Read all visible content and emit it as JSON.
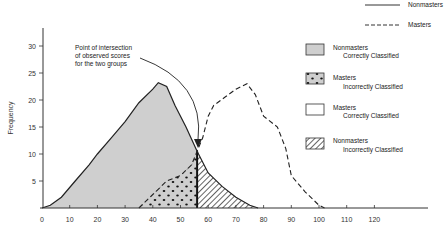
{
  "chart_data": {
    "type": "area",
    "title": "",
    "xlabel": "",
    "ylabel": "Frequency",
    "xlim": [
      0,
      130
    ],
    "ylim": [
      0,
      33
    ],
    "x_ticks": [
      "0",
      "10",
      "20",
      "30",
      "40",
      "50",
      "60",
      "70",
      "80",
      "90",
      "100",
      "110",
      "120"
    ],
    "y_ticks": [
      "5",
      "10",
      "15",
      "20",
      "25",
      "30"
    ],
    "grid": false,
    "legend_position": "right",
    "line_legend": [
      {
        "name": "Nonmasters",
        "style": "solid"
      },
      {
        "name": "Masters",
        "style": "dashed"
      }
    ],
    "series": [
      {
        "name": "Nonmasters",
        "style": "solid",
        "points": [
          [
            0,
            0
          ],
          [
            3,
            0.5
          ],
          [
            7,
            2
          ],
          [
            12,
            5
          ],
          [
            17,
            8
          ],
          [
            20,
            10
          ],
          [
            25,
            13
          ],
          [
            30,
            16
          ],
          [
            35,
            19.5
          ],
          [
            40,
            22
          ],
          [
            42,
            23.2
          ],
          [
            45,
            22.5
          ],
          [
            48,
            19
          ],
          [
            52,
            15
          ],
          [
            56,
            10.5
          ],
          [
            60,
            6.5
          ],
          [
            65,
            4
          ],
          [
            70,
            2
          ],
          [
            75,
            0.5
          ],
          [
            78,
            0
          ]
        ]
      },
      {
        "name": "Masters",
        "style": "dashed",
        "points": [
          [
            35,
            0
          ],
          [
            40,
            2.5
          ],
          [
            45,
            5
          ],
          [
            50,
            6
          ],
          [
            54,
            8
          ],
          [
            56,
            10.5
          ],
          [
            58,
            13
          ],
          [
            60,
            17
          ],
          [
            62,
            19
          ],
          [
            66,
            20.5
          ],
          [
            70,
            22
          ],
          [
            74,
            23
          ],
          [
            77,
            21
          ],
          [
            80,
            17
          ],
          [
            85,
            15
          ],
          [
            88,
            11
          ],
          [
            90,
            6
          ],
          [
            95,
            3
          ],
          [
            100,
            0.5
          ],
          [
            102,
            0
          ]
        ]
      }
    ],
    "cut_score": 56,
    "regions": [
      {
        "name": "Nonmasters Correctly Classified",
        "line1": "Nonmasters",
        "line2": "Correctly Classified",
        "fill": "gray"
      },
      {
        "name": "Masters Incorrectly Classified",
        "line1": "Masters",
        "line2": "Incorrectly Classified",
        "fill": "dotted"
      },
      {
        "name": "Masters Correctly Classified",
        "line1": "Masters",
        "line2": "Correctly Classified",
        "fill": "white"
      },
      {
        "name": "Nonmasters Incorrectly Classified",
        "line1": "Nonmasters",
        "line2": "Incorrectly Classified",
        "fill": "hatched"
      }
    ],
    "annotations": [
      {
        "lines": [
          "Point of intersection",
          "of observed scores",
          "for the two groups"
        ],
        "points_to": [
          56,
          10.5
        ]
      }
    ]
  },
  "colors": {
    "gray_fill": "#cfcfcf",
    "line": "#222222",
    "background": "#ffffff"
  }
}
